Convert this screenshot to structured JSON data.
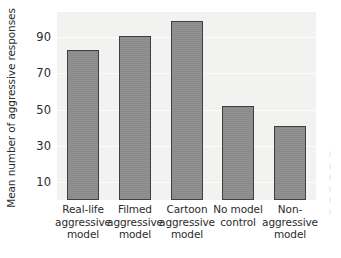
{
  "chart_data": {
    "type": "bar",
    "title": "",
    "subtitle": "",
    "xlabel": "",
    "ylabel": "Mean number of aggressive responses",
    "categories": [
      "Real-life aggressive model",
      "Filmed aggressive model",
      "Cartoon aggressive model",
      "No model control",
      "Non-aggressive model"
    ],
    "category_lines": [
      [
        "Real-life",
        "aggressive",
        "model"
      ],
      [
        "Filmed",
        "aggressive",
        "model"
      ],
      [
        "Cartoon",
        "aggressive",
        "model"
      ],
      [
        "No model",
        "control"
      ],
      [
        "Non-",
        "aggressive",
        "model"
      ]
    ],
    "values": [
      83,
      91,
      99,
      52,
      41
    ],
    "ylim": [
      0,
      104
    ],
    "yticks": [
      10,
      30,
      50,
      70,
      90
    ],
    "ytick_labels": [
      "10",
      "30",
      "50",
      "70",
      "90"
    ],
    "grid": true,
    "legend": null,
    "legend_position": "none",
    "colors": {
      "bar_fill": "#8c8c8c",
      "bar_edge": "#3f3f3f",
      "plot_background": "#f2f2f1",
      "page_background": "#ffffff",
      "gridline": "#fdfdfd",
      "text": "#2b2b2b"
    }
  },
  "margin_caption": "clipped text"
}
